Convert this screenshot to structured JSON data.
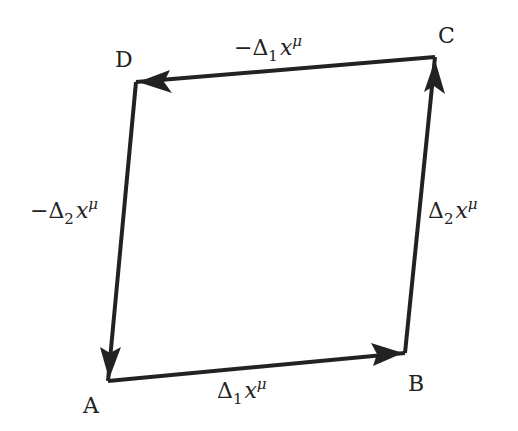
{
  "diagram": {
    "vertices": {
      "A": {
        "label": "A",
        "x": 108,
        "y": 381
      },
      "B": {
        "label": "B",
        "x": 405,
        "y": 353
      },
      "C": {
        "label": "C",
        "x": 435,
        "y": 57
      },
      "D": {
        "label": "D",
        "x": 136,
        "y": 82
      }
    },
    "edges": [
      {
        "from": "A",
        "to": "B",
        "label_sign": "",
        "label_delta": "Δ",
        "label_sub": "1",
        "label_var": "x",
        "label_sup": "μ"
      },
      {
        "from": "B",
        "to": "C",
        "label_sign": "",
        "label_delta": "Δ",
        "label_sub": "2",
        "label_var": "x",
        "label_sup": "μ"
      },
      {
        "from": "C",
        "to": "D",
        "label_sign": "−",
        "label_delta": "Δ",
        "label_sub": "1",
        "label_var": "x",
        "label_sup": "μ"
      },
      {
        "from": "D",
        "to": "A",
        "label_sign": "−",
        "label_delta": "Δ",
        "label_sub": "2",
        "label_var": "x",
        "label_sup": "μ"
      }
    ],
    "line_color": "#222222"
  }
}
